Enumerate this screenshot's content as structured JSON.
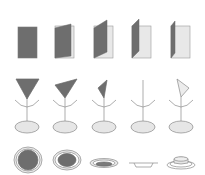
{
  "figure": {
    "colors": {
      "dark_fill": "#6e6e6e",
      "light_fill": "#e6e6e6",
      "stroke": "#8a8a8a",
      "background": "#ffffff"
    },
    "rows": [
      {
        "name": "book-opening-sequence",
        "items": [
          {
            "label": "book-closed"
          },
          {
            "label": "book-slightly-open"
          },
          {
            "label": "book-half-open"
          },
          {
            "label": "book-mostly-open"
          },
          {
            "label": "book-fully-open"
          }
        ]
      },
      {
        "name": "pointer-on-dish-sequence",
        "items": [
          {
            "label": "pointer-facing-front"
          },
          {
            "label": "pointer-turned-quarter"
          },
          {
            "label": "pointer-turned-side"
          },
          {
            "label": "pointer-edge-on"
          },
          {
            "label": "pointer-turned-back"
          }
        ]
      },
      {
        "name": "plate-tilting-sequence",
        "items": [
          {
            "label": "plate-top-view"
          },
          {
            "label": "plate-tilted"
          },
          {
            "label": "plate-oblique"
          },
          {
            "label": "plate-edge-on"
          },
          {
            "label": "plate-upside-down"
          }
        ]
      }
    ]
  }
}
